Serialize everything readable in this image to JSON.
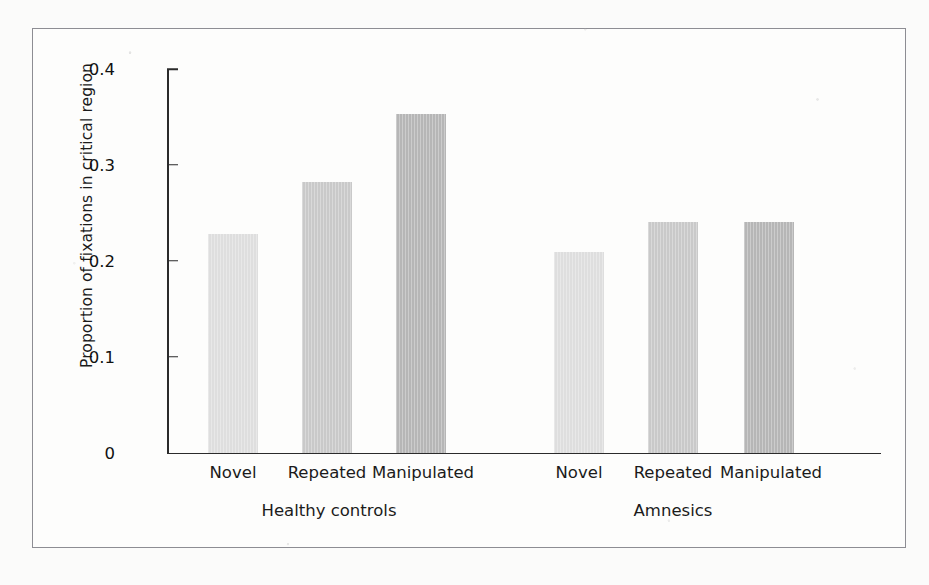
{
  "figure": {
    "frame_color": "#8d8d93",
    "background": "#fbfbfa"
  },
  "chart_data": {
    "type": "bar",
    "title": "",
    "subtitle": "",
    "xlabel": "",
    "ylabel": "Proportion of fixations in critical region",
    "ylim": [
      0,
      0.4
    ],
    "yticks": [
      "0",
      "0.1",
      "0.2",
      "0.3",
      "0.4"
    ],
    "ytick_values": [
      0,
      0.1,
      0.2,
      0.3,
      0.4
    ],
    "grid": false,
    "legend": "none",
    "categories": [
      "Novel",
      "Repeated",
      "Manipulated"
    ],
    "groups": [
      "Healthy controls",
      "Amnesics"
    ],
    "series": [
      {
        "name": "Healthy controls",
        "values": [
          0.228,
          0.282,
          0.353
        ]
      },
      {
        "name": "Amnesics",
        "values": [
          0.209,
          0.24,
          0.24
        ]
      }
    ],
    "bars": [
      {
        "group": "Healthy controls",
        "category": "Novel",
        "value": 0.228,
        "color": "#dedede"
      },
      {
        "group": "Healthy controls",
        "category": "Repeated",
        "value": 0.282,
        "color": "#c9c9c9"
      },
      {
        "group": "Healthy controls",
        "category": "Manipulated",
        "value": 0.353,
        "color": "#b6b6b6"
      },
      {
        "group": "Amnesics",
        "category": "Novel",
        "value": 0.209,
        "color": "#dedede"
      },
      {
        "group": "Amnesics",
        "category": "Repeated",
        "value": 0.24,
        "color": "#c9c9c9"
      },
      {
        "group": "Amnesics",
        "category": "Manipulated",
        "value": 0.24,
        "color": "#b6b6b6"
      }
    ],
    "category_colors": {
      "Novel": "#dedede",
      "Repeated": "#c9c9c9",
      "Manipulated": "#b6b6b6"
    }
  }
}
